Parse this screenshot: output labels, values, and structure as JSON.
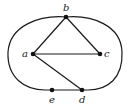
{
  "diagram": {
    "type": "graph",
    "colors": {
      "stroke": "#1a1a1a",
      "vertex": "#111111",
      "label": "#222222",
      "background": "#ffffff"
    },
    "vertices": [
      {
        "id": "a",
        "label": "a",
        "x": 33,
        "y": 54,
        "label_x": 24,
        "label_y": 57
      },
      {
        "id": "b",
        "label": "b",
        "x": 66,
        "y": 17,
        "label_x": 64,
        "label_y": 11
      },
      {
        "id": "c",
        "label": "c",
        "x": 100,
        "y": 54,
        "label_x": 104,
        "label_y": 57
      },
      {
        "id": "d",
        "label": "d",
        "x": 82,
        "y": 90,
        "label_x": 78,
        "label_y": 102
      },
      {
        "id": "e",
        "label": "e",
        "x": 52,
        "y": 90,
        "label_x": 49,
        "label_y": 102
      }
    ],
    "edges": [
      {
        "from": "a",
        "to": "b"
      },
      {
        "from": "b",
        "to": "c"
      },
      {
        "from": "a",
        "to": "c"
      },
      {
        "from": "a",
        "to": "d"
      },
      {
        "from": "e",
        "to": "d"
      }
    ],
    "outer_curve": {
      "description": "closed oval loop passing through b (top), e and d (bottom)",
      "passes_through": [
        "b",
        "e",
        "d"
      ]
    }
  }
}
